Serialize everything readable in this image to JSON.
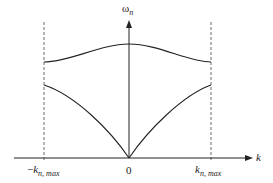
{
  "diagram": {
    "axes": {
      "y_label": {
        "symbol": "ω",
        "subscript": "n"
      },
      "x_label": "k",
      "origin_label": "0",
      "left_boundary_label": {
        "prefix": "−",
        "symbol": "k",
        "subscript": "n, max"
      },
      "right_boundary_label": {
        "symbol": "k",
        "subscript": "n, max"
      }
    },
    "colors": {
      "line": "#222222",
      "background": "#ffffff"
    },
    "elements": [
      "x-axis with arrow",
      "y-axis with arrow",
      "dashed boundary line at -k_n,max",
      "dashed boundary line at k_n,max",
      "upper (optical) branch curve",
      "lower (acoustic) branch curve"
    ]
  }
}
